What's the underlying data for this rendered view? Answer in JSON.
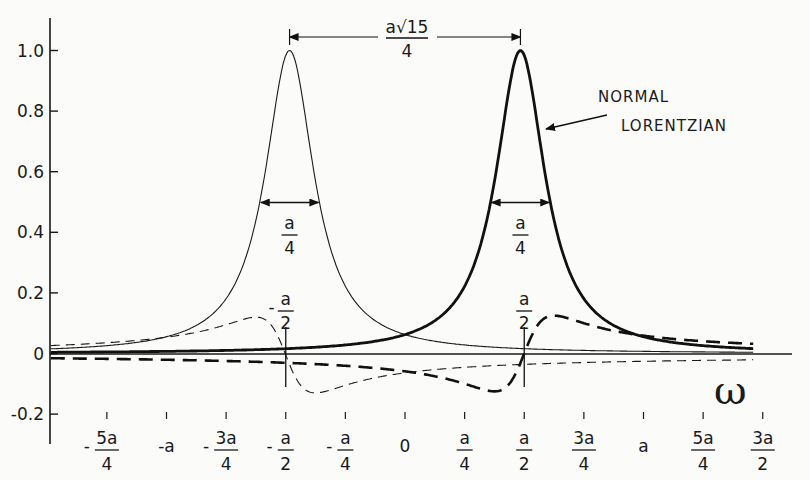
{
  "chart_data": {
    "type": "line",
    "title": "",
    "xlabel": "ω",
    "ylabel": "",
    "ylim": [
      -0.2,
      1.0
    ],
    "xlim_in_units_of_a": [
      -1.5,
      1.5
    ],
    "grid": false,
    "y_ticks": [
      "1.0",
      "0.8",
      "0.6",
      "0.4",
      "0.2",
      "0",
      "-0.2"
    ],
    "y_tick_values": [
      1.0,
      0.8,
      0.6,
      0.4,
      0.2,
      0,
      -0.2
    ],
    "x_ticks": [
      {
        "value": -1.25,
        "sign": "-",
        "num": "5a",
        "den": "4"
      },
      {
        "value": -1.0,
        "sign": "",
        "num": "-a",
        "den": ""
      },
      {
        "value": -0.75,
        "sign": "-",
        "num": "3a",
        "den": "4"
      },
      {
        "value": -0.5,
        "sign": "-",
        "num": "a",
        "den": "2"
      },
      {
        "value": -0.25,
        "sign": "-",
        "num": "a",
        "den": "4"
      },
      {
        "value": 0,
        "sign": "",
        "num": "0",
        "den": ""
      },
      {
        "value": 0.25,
        "sign": "",
        "num": "a",
        "den": "4"
      },
      {
        "value": 0.5,
        "sign": "",
        "num": "a",
        "den": "2"
      },
      {
        "value": 0.75,
        "sign": "",
        "num": "3a",
        "den": "4"
      },
      {
        "value": 1.0,
        "sign": "",
        "num": "a",
        "den": ""
      },
      {
        "value": 1.25,
        "sign": "",
        "num": "5a",
        "den": "4"
      },
      {
        "value": 1.5,
        "sign": "",
        "num": "3a",
        "den": "2"
      }
    ],
    "series": [
      {
        "name": "Lorentzian (left, thin solid)",
        "style": "thin-solid",
        "kind": "absorption",
        "center": -0.484,
        "half_width": 0.125,
        "peak": 1.0
      },
      {
        "name": "Normal Lorentzian (right, thick solid)",
        "style": "thick-solid",
        "kind": "absorption",
        "center": 0.484,
        "half_width": 0.125,
        "peak": 1.0
      },
      {
        "name": "Dispersion (left, thin dashed)",
        "style": "thin-dashed",
        "kind": "dispersion",
        "center": -0.5,
        "half_width": 0.125,
        "amplitude": 0.25,
        "offset": -0.005
      },
      {
        "name": "Dispersion (right, thick dashed)",
        "style": "thick-dashed",
        "kind": "dispersion",
        "center": 0.5,
        "half_width": 0.125,
        "amplitude": -0.25,
        "offset": 0.0
      }
    ],
    "annotations": [
      {
        "text": "a√15 / 4",
        "type": "peak-separation",
        "num": "a√15",
        "den": "4",
        "from": -0.484,
        "to": 0.484,
        "y": 0.98
      },
      {
        "text": "a/4",
        "type": "fwhm-left",
        "num": "a",
        "den": "4",
        "from": -0.609,
        "to": -0.359,
        "y": 0.5
      },
      {
        "text": "a/4",
        "type": "fwhm-right",
        "num": "a",
        "den": "4",
        "from": 0.359,
        "to": 0.609,
        "y": 0.5
      },
      {
        "text": "-a/2",
        "type": "marker-left",
        "sign": "-",
        "num": "a",
        "den": "2",
        "x": -0.5
      },
      {
        "text": "a/2",
        "type": "marker-right",
        "sign": "",
        "num": "a",
        "den": "2",
        "x": 0.5
      },
      {
        "text": "NORMAL LORENTZIAN",
        "line1": "NORMAL",
        "line2": "LORENTZIAN",
        "type": "label-arrow",
        "points_to": "right Lorentzian"
      }
    ],
    "axis_symbol": "ω"
  }
}
